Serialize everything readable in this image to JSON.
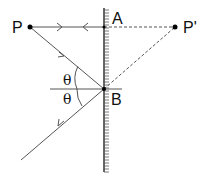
{
  "diagram": {
    "type": "plane-mirror-reflection",
    "points": {
      "P": {
        "label": "P",
        "x": 30,
        "y": 27
      },
      "P_image": {
        "label": "P'",
        "x": 175,
        "y": 27
      },
      "A": {
        "label": "A",
        "x": 104,
        "y": 27
      },
      "B": {
        "label": "B",
        "x": 104,
        "y": 89
      }
    },
    "angles": {
      "incidence": {
        "label": "θ"
      },
      "reflection": {
        "label": "θ"
      }
    },
    "mirror": {
      "x": 104,
      "y_top": 8,
      "y_bottom": 172
    },
    "colors": {
      "line": "#555555",
      "text": "#111111",
      "dot": "#000000"
    }
  }
}
